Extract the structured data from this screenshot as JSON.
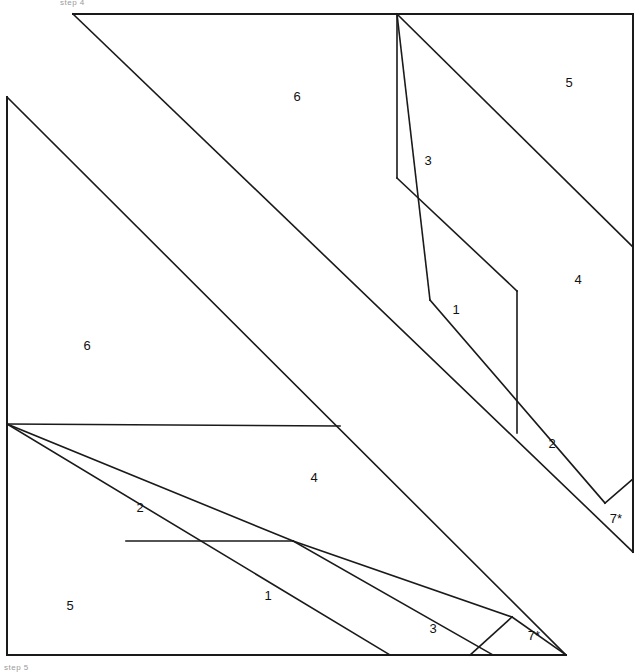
{
  "figure": {
    "title_fragment_top": "step 4",
    "title_fragment_bottom": "step 5",
    "stroke_color": "#1a1a1a",
    "background_color": "#ffffff",
    "label_color": "#111111",
    "width": 640,
    "height": 671
  },
  "labels": [
    {
      "text": "6",
      "x": 297,
      "y": 98,
      "name": "piece-label-6-upper"
    },
    {
      "text": "5",
      "x": 569,
      "y": 84,
      "name": "piece-label-5-upper"
    },
    {
      "text": "3",
      "x": 428,
      "y": 162,
      "name": "piece-label-3-upper"
    },
    {
      "text": "4",
      "x": 578,
      "y": 281,
      "name": "piece-label-4-upper"
    },
    {
      "text": "1",
      "x": 456,
      "y": 311,
      "name": "piece-label-1-upper"
    },
    {
      "text": "2",
      "x": 552,
      "y": 445,
      "name": "piece-label-2-upper"
    },
    {
      "text": "7*",
      "x": 616,
      "y": 520,
      "name": "piece-label-7star-upper"
    },
    {
      "text": "6",
      "x": 87,
      "y": 347,
      "name": "piece-label-6-lower"
    },
    {
      "text": "4",
      "x": 314,
      "y": 479,
      "name": "piece-label-4-lower"
    },
    {
      "text": "2",
      "x": 140,
      "y": 509,
      "name": "piece-label-2-lower"
    },
    {
      "text": "1",
      "x": 268,
      "y": 597,
      "name": "piece-label-1-lower"
    },
    {
      "text": "5",
      "x": 70,
      "y": 607,
      "name": "piece-label-5-lower"
    },
    {
      "text": "3",
      "x": 433,
      "y": 630,
      "name": "piece-label-3-lower"
    },
    {
      "text": "7*",
      "x": 534,
      "y": 637,
      "name": "piece-label-7star-lower"
    }
  ],
  "segments": [
    {
      "name": "frame-top-edge",
      "x1": 73,
      "y1": 14,
      "x2": 633,
      "y2": 14,
      "kind": "frame"
    },
    {
      "name": "frame-right-edge",
      "x1": 633,
      "y1": 14,
      "x2": 633,
      "y2": 552,
      "kind": "frame"
    },
    {
      "name": "frame-left-edge",
      "x1": 7,
      "y1": 97,
      "x2": 7,
      "y2": 655,
      "kind": "frame"
    },
    {
      "name": "frame-bottom-edge",
      "x1": 7,
      "y1": 655,
      "x2": 566,
      "y2": 655,
      "kind": "frame"
    },
    {
      "name": "upper-hypotenuse-main",
      "x1": 73,
      "y1": 14,
      "x2": 633,
      "y2": 552,
      "kind": "edge"
    },
    {
      "name": "lower-hypotenuse-main",
      "x1": 7,
      "y1": 97,
      "x2": 566,
      "y2": 655,
      "kind": "edge"
    },
    {
      "name": "upper-apex-to-vertex-3",
      "x1": 397,
      "y1": 14,
      "x2": 430,
      "y2": 300,
      "kind": "edge"
    },
    {
      "name": "upper-apex-to-vertex-5",
      "x1": 397,
      "y1": 14,
      "x2": 633,
      "y2": 247,
      "kind": "edge"
    },
    {
      "name": "upper-apex-vertical",
      "x1": 397,
      "y1": 14,
      "x2": 397,
      "y2": 178,
      "kind": "edge"
    },
    {
      "name": "upper-slant-3-to-1",
      "x1": 397,
      "y1": 178,
      "x2": 517,
      "y2": 291,
      "kind": "edge"
    },
    {
      "name": "upper-vertical-right",
      "x1": 517,
      "y1": 291,
      "x2": 517,
      "y2": 433,
      "kind": "edge"
    },
    {
      "name": "upper-diagonal-to-7star",
      "x1": 430,
      "y1": 300,
      "x2": 605,
      "y2": 503,
      "kind": "edge"
    },
    {
      "name": "upper-7star-short-edge",
      "x1": 605,
      "y1": 503,
      "x2": 633,
      "y2": 479,
      "kind": "edge"
    },
    {
      "name": "lower-fan-to-vertex-4",
      "x1": 7,
      "y1": 424,
      "x2": 293,
      "y2": 541,
      "kind": "edge"
    },
    {
      "name": "lower-fan-to-vertex-2",
      "x1": 7,
      "y1": 424,
      "x2": 390,
      "y2": 655,
      "kind": "edge"
    },
    {
      "name": "lower-horizontal-band",
      "x1": 7,
      "y1": 424,
      "x2": 340,
      "y2": 426,
      "kind": "edge"
    },
    {
      "name": "lower-horizontal-inner",
      "x1": 126,
      "y1": 541,
      "x2": 293,
      "y2": 541,
      "kind": "edge"
    },
    {
      "name": "lower-slant-1-to-3",
      "x1": 293,
      "y1": 541,
      "x2": 512,
      "y2": 617,
      "kind": "edge"
    },
    {
      "name": "lower-slant-3-to-bottom",
      "x1": 293,
      "y1": 541,
      "x2": 493,
      "y2": 655,
      "kind": "edge"
    },
    {
      "name": "lower-7star-left-edge",
      "x1": 512,
      "y1": 617,
      "x2": 470,
      "y2": 655,
      "kind": "edge"
    },
    {
      "name": "lower-7star-right-edge",
      "x1": 512,
      "y1": 617,
      "x2": 566,
      "y2": 655,
      "kind": "edge"
    }
  ]
}
